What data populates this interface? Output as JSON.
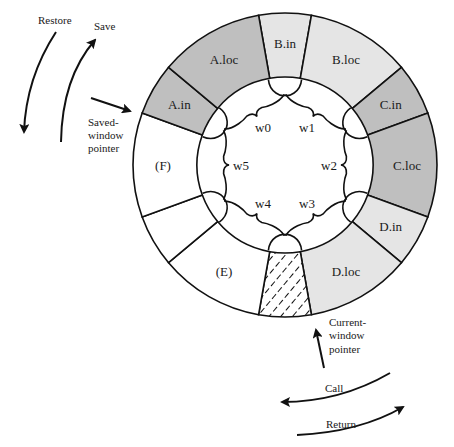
{
  "colors": {
    "dark": "#bfbfbf",
    "light": "#e5e5e5",
    "white": "#ffffff",
    "line": "#111111"
  },
  "geometry": {
    "cx": 285,
    "cy": 165,
    "outer_r": 152,
    "inner_r": 88
  },
  "segments": [
    {
      "label": "B.in",
      "start": 260,
      "end": 280,
      "fill": "light"
    },
    {
      "label": "B.loc",
      "start": 280,
      "end": 320,
      "fill": "light"
    },
    {
      "label": "C.in",
      "start": 320,
      "end": 340,
      "fill": "dark"
    },
    {
      "label": "C.loc",
      "start": 340,
      "end": 380,
      "fill": "dark"
    },
    {
      "label": "D.in",
      "start": 20,
      "end": 40,
      "fill": "light"
    },
    {
      "label": "D.loc",
      "start": 40,
      "end": 80,
      "fill": "light"
    },
    {
      "label": "",
      "start": 80,
      "end": 100,
      "fill": "hatch"
    },
    {
      "label": "(E)",
      "start": 100,
      "end": 140,
      "fill": "white"
    },
    {
      "label": "",
      "start": 140,
      "end": 160,
      "fill": "white"
    },
    {
      "label": "(F)",
      "start": 160,
      "end": 200,
      "fill": "white"
    },
    {
      "label": "A.in",
      "start": 200,
      "end": 220,
      "fill": "dark"
    },
    {
      "label": "A.loc",
      "start": 220,
      "end": 260,
      "fill": "dark"
    }
  ],
  "windows": [
    {
      "label": "w0",
      "angle": 240
    },
    {
      "label": "w1",
      "angle": 300
    },
    {
      "label": "w2",
      "angle": 0
    },
    {
      "label": "w3",
      "angle": 60
    },
    {
      "label": "w4",
      "angle": 120
    },
    {
      "label": "w5",
      "angle": 180
    }
  ],
  "annotations": {
    "restore": "Restore",
    "save": "Save",
    "saved_pointer": [
      "Saved-",
      "window",
      "pointer"
    ],
    "current_pointer": [
      "Current-",
      "window",
      "pointer"
    ],
    "call": "Call",
    "return": "Return"
  }
}
